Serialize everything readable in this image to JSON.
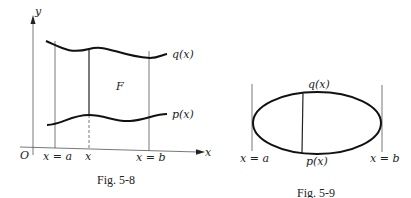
{
  "figures": [
    {
      "id": "fig-5-8",
      "caption": "Fig. 5-8",
      "axes": {
        "x_label": "x",
        "y_label": "y",
        "origin_label": "O"
      },
      "curves": [
        {
          "name": "upper",
          "label": "q(x)"
        },
        {
          "name": "lower",
          "label": "p(x)"
        }
      ],
      "region_label": "F",
      "x_ticks": [
        "x = a",
        "x",
        "x = b"
      ]
    },
    {
      "id": "fig-5-9",
      "caption": "Fig. 5-9",
      "shape": "ellipse",
      "top_label": "q(x)",
      "bottom_label": "p(x)",
      "x_ticks": [
        "x = a",
        "x = b"
      ]
    }
  ]
}
